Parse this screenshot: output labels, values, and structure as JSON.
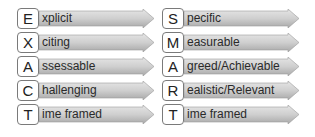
{
  "diagram": {
    "colors": {
      "arrow_light": "#d8d8d8",
      "arrow_dark": "#a9a9a9",
      "box_border": "#7a7a7a"
    },
    "left": {
      "acronym": "EXACT",
      "items": [
        {
          "letter": "E",
          "rest": "xplicit"
        },
        {
          "letter": "X",
          "rest": "citing"
        },
        {
          "letter": "A",
          "rest": "ssessable"
        },
        {
          "letter": "C",
          "rest": "hallenging"
        },
        {
          "letter": "T",
          "rest": "ime framed"
        }
      ]
    },
    "right": {
      "acronym": "SMART",
      "items": [
        {
          "letter": "S",
          "rest": "pecific"
        },
        {
          "letter": "M",
          "rest": "easurable"
        },
        {
          "letter": "A",
          "rest": "greed/Achievable"
        },
        {
          "letter": "R",
          "rest": "ealistic/Relevant"
        },
        {
          "letter": "T",
          "rest": "ime framed"
        }
      ]
    }
  }
}
